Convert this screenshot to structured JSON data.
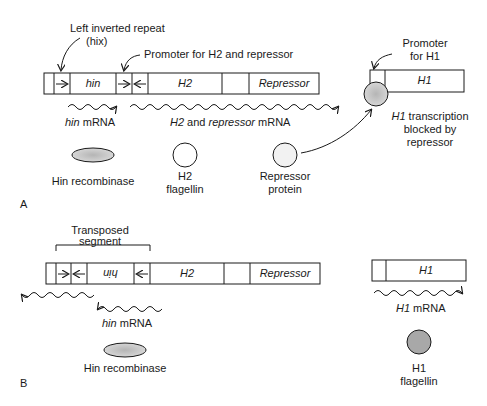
{
  "panel_a": {
    "label": "A",
    "left_inverted_repeat": "Left inverted repeat",
    "hix": "(hix)",
    "promoter_h2": "Promoter for H2 and repressor",
    "gene_hin": "hin",
    "gene_h2": "H2",
    "gene_repressor": "Repressor",
    "promoter_h1_line1": "Promoter",
    "promoter_h1_line2": "for H1",
    "gene_h1": "H1",
    "hin_mrna_gene": "hin",
    "hin_mrna_suffix": " mRNA",
    "h2_mrna_gene": "H2",
    "h2_mrna_and": " and ",
    "h2_mrna_rep": "repressor",
    "h2_mrna_suffix": " mRNA",
    "blocked_gene": "H1",
    "blocked_line1": " transcription",
    "blocked_line2": "blocked by",
    "blocked_line3": "repressor",
    "protein_hin": "Hin recombinase",
    "protein_h2_line1": "H2",
    "protein_h2_line2": "flagellin",
    "protein_rep_line1": "Repressor",
    "protein_rep_line2": "protein"
  },
  "panel_b": {
    "label": "B",
    "transposed_line1": "Transposed",
    "transposed_line2": "segment",
    "gene_hin_inverted": "hin",
    "gene_h2": "H2",
    "gene_repressor": "Repressor",
    "gene_h1": "H1",
    "hin_mrna_gene": "hin",
    "hin_mrna_suffix": " mRNA",
    "h1_mrna_gene": "H1",
    "h1_mrna_suffix": " mRNA",
    "protein_hin": "Hin recombinase",
    "protein_h1_line1": "H1",
    "protein_h1_line2": "flagellin"
  }
}
